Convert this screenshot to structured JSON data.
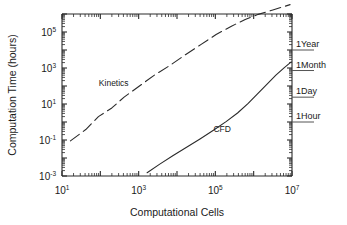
{
  "chart_data": {
    "type": "line",
    "title": "",
    "xlabel": "Computational Cells",
    "ylabel": "Computation Time (hours)",
    "xscale": "log",
    "yscale": "log",
    "xlim": [
      10,
      10000000
    ],
    "ylim": [
      0.001,
      1000000
    ],
    "grid": false,
    "legend": "inline-curve-labels",
    "xticks": [
      {
        "label_base": "10",
        "label_exp": "1",
        "value": 10
      },
      {
        "label_base": "10",
        "label_exp": "3",
        "value": 1000
      },
      {
        "label_base": "10",
        "label_exp": "5",
        "value": 100000
      },
      {
        "label_base": "10",
        "label_exp": "7",
        "value": 10000000
      }
    ],
    "yticks": [
      {
        "label_base": "10",
        "label_exp": "-3",
        "value": 0.001
      },
      {
        "label_base": "10",
        "label_exp": "-1",
        "value": 0.1
      },
      {
        "label_base": "10",
        "label_exp": "1",
        "value": 10
      },
      {
        "label_base": "10",
        "label_exp": "3",
        "value": 1000
      },
      {
        "label_base": "10",
        "label_exp": "5",
        "value": 100000
      }
    ],
    "series": [
      {
        "name": "Kinetics",
        "style": "dashed",
        "label_x": 2.35,
        "label_y": 2.0,
        "points": [
          [
            1.22,
            -1.05
          ],
          [
            1.62,
            -0.42
          ],
          [
            1.95,
            0.3
          ],
          [
            2.3,
            0.78
          ],
          [
            2.62,
            1.38
          ],
          [
            3.02,
            2.0
          ],
          [
            3.42,
            2.62
          ],
          [
            3.8,
            3.12
          ],
          [
            4.22,
            3.74
          ],
          [
            4.62,
            4.3
          ],
          [
            5.02,
            4.86
          ],
          [
            5.42,
            5.32
          ],
          [
            5.78,
            5.7
          ],
          [
            6.12,
            5.98
          ],
          [
            6.5,
            6.22
          ],
          [
            6.95,
            6.52
          ]
        ]
      },
      {
        "name": "CFD",
        "style": "solid",
        "label_x": 5.18,
        "label_y": -0.55,
        "points": [
          [
            3.22,
            -2.82
          ],
          [
            3.55,
            -2.34
          ],
          [
            3.9,
            -1.86
          ],
          [
            4.25,
            -1.4
          ],
          [
            4.6,
            -0.94
          ],
          [
            4.95,
            -0.46
          ],
          [
            5.28,
            0.02
          ],
          [
            5.58,
            0.5
          ],
          [
            5.85,
            1.02
          ],
          [
            6.1,
            1.56
          ],
          [
            6.35,
            2.1
          ],
          [
            6.58,
            2.6
          ],
          [
            6.8,
            3.02
          ],
          [
            6.98,
            3.34
          ]
        ]
      }
    ],
    "reference_lines": [
      {
        "label": "1Year",
        "y_value": 4.0,
        "note": "8766 hours"
      },
      {
        "label": "1Month",
        "y_value": 2.86,
        "note": "730 hours"
      },
      {
        "label": "1Day",
        "y_value": 1.38,
        "note": "24 hours"
      },
      {
        "label": "1Hour",
        "y_value": 0.0,
        "note": "1 hour"
      }
    ]
  },
  "axes": {
    "x_label": "Computational Cells",
    "y_label": "Computation Time (hours)"
  }
}
